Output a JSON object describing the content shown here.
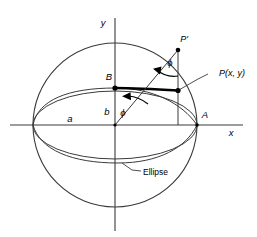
{
  "figure": {
    "background_color": "#ffffff",
    "stroke_color": "#1a1a1a",
    "thick_stroke_color": "#000000"
  },
  "axes": {
    "x_label": "x",
    "y_label": "y",
    "origin_x": 115,
    "origin_y": 125
  },
  "points": {
    "A": {
      "label": "A",
      "x": 197,
      "y": 125
    },
    "B": {
      "label": "B",
      "x": 115,
      "y": 88
    },
    "P_prime": {
      "label": "P'",
      "x": 178,
      "y": 50
    },
    "P": {
      "label": "P(x, y)",
      "x": 178,
      "y": 90
    }
  },
  "segments": {
    "semi_major_label": "a",
    "semi_minor_label": "b"
  },
  "angles": {
    "phi_origin_label": "ϕ",
    "phi_upper_label": "ϕ"
  },
  "annotations": {
    "ellipse_label": "Ellipse"
  },
  "geometry": {
    "circle_center_x": 115,
    "circle_center_y": 125,
    "circle_radius": 82,
    "ellipse_rx": 82,
    "ellipse_ry": 37
  }
}
